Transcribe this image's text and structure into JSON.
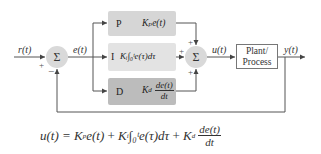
{
  "diagram": {
    "colors": {
      "p_block": "#d6d6d6",
      "i_block": "#e3e3e3",
      "d_block": "#bcbcbc",
      "sum_node": "#d9d9d9",
      "line": "#555555"
    },
    "signals": {
      "reference": "r(t)",
      "error": "e(t)",
      "control": "u(t)",
      "output": "y(t)"
    },
    "sum1": {
      "symbol": "Σ",
      "signs": [
        "+",
        "−"
      ]
    },
    "sum2": {
      "symbol": "Σ",
      "signs": [
        "+",
        "+",
        "+"
      ]
    },
    "blocks": [
      {
        "letter": "P",
        "expression": "Kₚe(t)"
      },
      {
        "letter": "I",
        "expression": "Kᵢ∫₀ᵗe(τ)dτ"
      },
      {
        "letter": "D",
        "expression_coef": "K",
        "expression_sub": "d",
        "expression_num": "de(t)",
        "expression_den": "dt"
      }
    ],
    "plant": {
      "line1": "Plant/",
      "line2": "Process"
    }
  },
  "formula": {
    "lhs": "u(t) =",
    "term1_coef": "K",
    "term1_sub": "p",
    "term1_rest": "e(t)",
    "plus1": "+",
    "term2_coef": "K",
    "term2_sub": "i",
    "term2_rest": "∫₀ᵗe(τ)dτ",
    "plus2": "+",
    "term3_coef": "K",
    "term3_sub": "d",
    "term3_num": "de(t)",
    "term3_den": "dt"
  }
}
